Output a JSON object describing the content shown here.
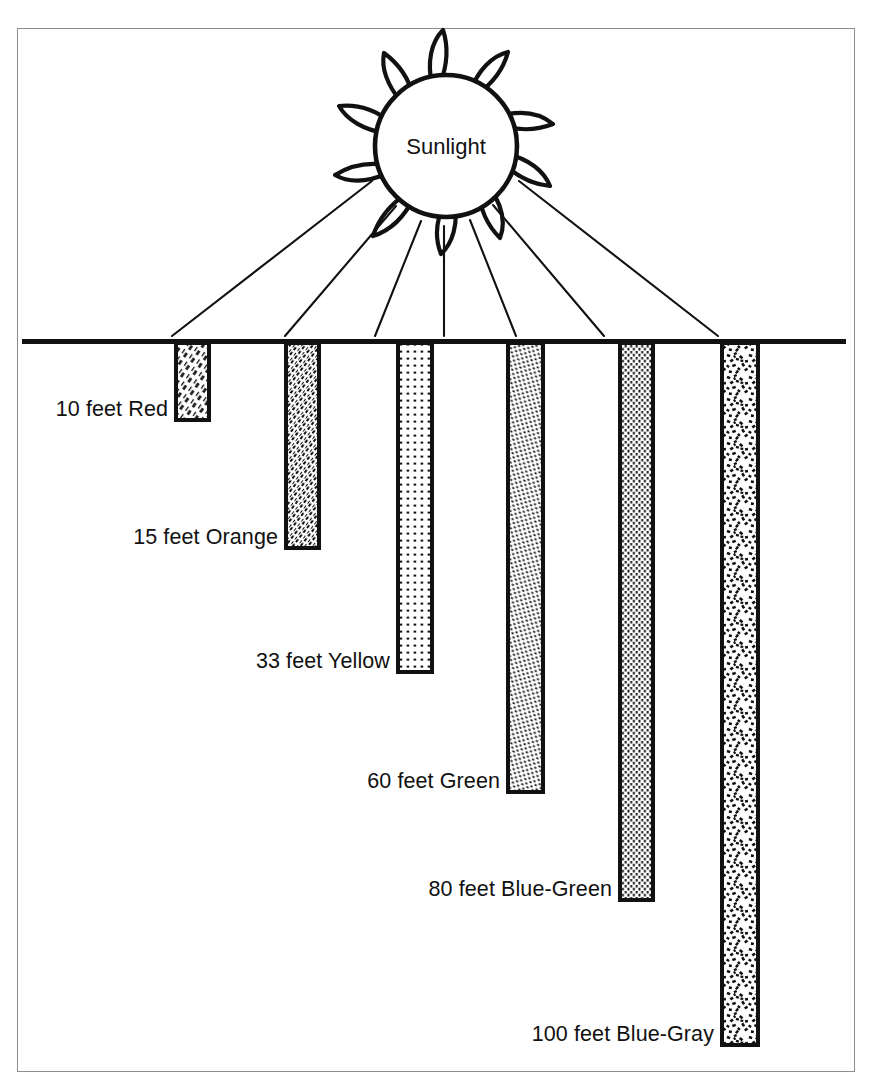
{
  "figure": {
    "sun_label": "Sunlight",
    "water_line_label": "water-surface",
    "ray_count": 7
  },
  "chart_data": {
    "type": "bar",
    "subtitle": "Sunlight",
    "orientation": "vertical-descending",
    "xlabel": "",
    "ylabel": "Depth (feet)",
    "ylim": [
      0,
      100
    ],
    "grid": false,
    "legend": "none",
    "units": "feet",
    "categories": [
      "Red",
      "Orange",
      "Yellow",
      "Green",
      "Blue-Green",
      "Blue-Gray"
    ],
    "values": [
      10,
      15,
      33,
      60,
      80,
      100
    ],
    "labels": [
      "10 feet Red",
      "15 feet Orange",
      "33 feet Yellow",
      "60 feet Green",
      "80 feet Blue-Green",
      "100 feet Blue-Gray"
    ],
    "bars": [
      {
        "color_name": "Red",
        "depth": 10,
        "label": "10 feet Red",
        "fill": "diagonal-hatch-coarse",
        "x": 176,
        "width": 33,
        "top": 343,
        "bottom": 420,
        "label_x": 40,
        "label_y": 397
      },
      {
        "color_name": "Orange",
        "depth": 15,
        "label": "15 feet Orange",
        "fill": "diagonal-hatch-fine",
        "x": 286,
        "width": 33,
        "top": 343,
        "bottom": 548,
        "label_x": 93,
        "label_y": 525
      },
      {
        "color_name": "Yellow",
        "depth": 33,
        "label": "33 feet Yellow",
        "fill": "square-dot-grid",
        "x": 398,
        "width": 34,
        "top": 343,
        "bottom": 672,
        "label_x": 243,
        "label_y": 649
      },
      {
        "color_name": "Green",
        "depth": 60,
        "label": "60 feet Green",
        "fill": "dense-stipple-diagonal",
        "x": 508,
        "width": 35,
        "top": 343,
        "bottom": 792,
        "label_x": 355,
        "label_y": 769
      },
      {
        "color_name": "Blue-Green",
        "depth": 80,
        "label": "80 feet Blue-Green",
        "fill": "vertical-dotted-lines",
        "x": 620,
        "width": 33,
        "top": 343,
        "bottom": 900,
        "label_x": 415,
        "label_y": 877
      },
      {
        "color_name": "Blue-Gray",
        "depth": 100,
        "label": "100 feet Blue-Gray",
        "fill": "coarse-random-stipple",
        "x": 722,
        "width": 36,
        "top": 343,
        "bottom": 1045,
        "label_x": 500,
        "label_y": 1022
      }
    ]
  },
  "colors": {
    "ink": "#111111",
    "frame": "#8d8d8d",
    "background": "#ffffff",
    "fill": "#ffffff"
  }
}
